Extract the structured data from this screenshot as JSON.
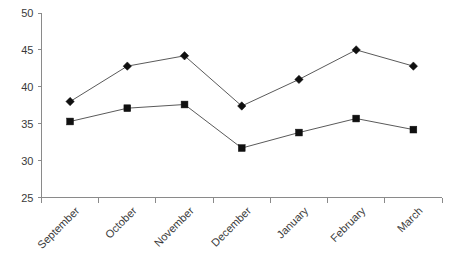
{
  "chart_data": {
    "type": "line",
    "title": "",
    "subtitle": "",
    "xlabel": "",
    "ylabel": "",
    "categories": [
      "September",
      "October",
      "November",
      "December",
      "January",
      "February",
      "March"
    ],
    "series": [
      {
        "name": "series-1-diamond",
        "marker": "diamond",
        "values": [
          38.0,
          42.8,
          44.2,
          37.4,
          41.0,
          45.0,
          42.8
        ]
      },
      {
        "name": "series-2-square",
        "marker": "square",
        "values": [
          35.3,
          37.1,
          37.6,
          31.7,
          33.8,
          35.7,
          34.2
        ]
      }
    ],
    "ylim": [
      25,
      50
    ],
    "ytick_values": [
      25,
      30,
      35,
      40,
      45,
      50
    ],
    "ytick_labels": [
      "25",
      "30",
      "35",
      "40",
      "45",
      "50"
    ],
    "grid": false,
    "legend": "none",
    "xtick_rotation_deg": -45,
    "colors": {
      "line": "#5a5a5a",
      "marker": "#101010",
      "axis": "#8a8a8a",
      "text": "#3a3a3a",
      "background": "#ffffff"
    }
  }
}
